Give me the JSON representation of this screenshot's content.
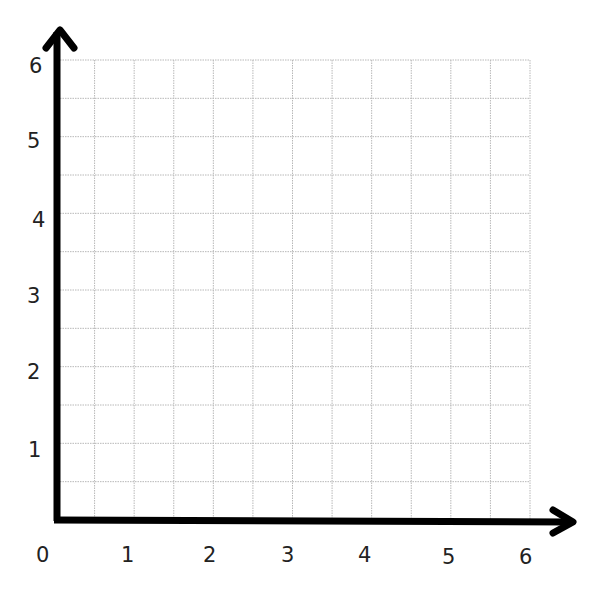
{
  "chart_data": {
    "type": "scatter",
    "title": "",
    "xlabel": "",
    "ylabel": "",
    "xlim": [
      0,
      6
    ],
    "ylim": [
      0,
      6
    ],
    "x_ticks": [
      "0",
      "1",
      "2",
      "3",
      "4",
      "5",
      "6"
    ],
    "y_ticks": [
      "1",
      "2",
      "3",
      "4",
      "5",
      "6"
    ],
    "grid": true,
    "grid_step": 0.5,
    "series": [],
    "axis_arrows": true
  },
  "labels": {
    "x": [
      "0",
      "1",
      "2",
      "3",
      "4",
      "5",
      "6"
    ],
    "y": [
      "1",
      "2",
      "3",
      "4",
      "5",
      "6"
    ]
  },
  "colors": {
    "axis": "#000000",
    "grid": "#b8b8b8",
    "text": "#222222"
  }
}
